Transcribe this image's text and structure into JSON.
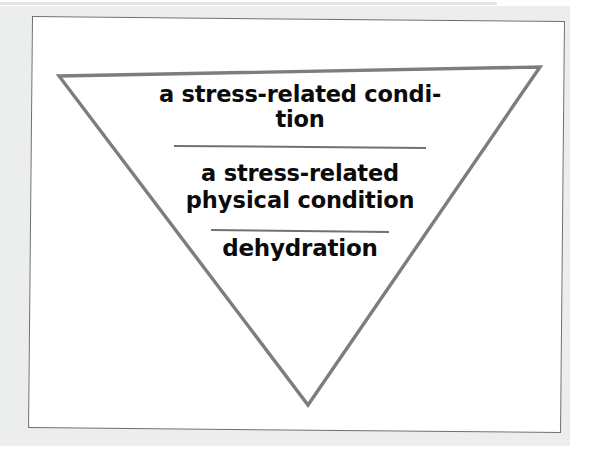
{
  "figure": {
    "type": "inverted-triangle-hierarchy",
    "levels": [
      {
        "rank": 1,
        "scope": "broad",
        "text": "a stress-related condi-tion",
        "line_1": "a stress-related condi-",
        "line_2": "tion"
      },
      {
        "rank": 2,
        "scope": "intermediate",
        "text": "a stress-related physical condition",
        "line_1": "a stress-related",
        "line_2_emphasis": "physical",
        "line_2_rest": " condition"
      },
      {
        "rank": 3,
        "scope": "specific",
        "text": "dehydration"
      }
    ],
    "dividers": [
      {
        "index": 1,
        "between": "level-1-and-level-2"
      },
      {
        "index": 2,
        "between": "level-2-and-level-3"
      }
    ]
  },
  "colors": {
    "triangle_stroke": "#7b7d7f",
    "frame_border": "#6d6f71",
    "divider": "#6f7173",
    "text": "#0b0b0b",
    "page_background": "#ffffff",
    "scan_backdrop": "#eceded"
  }
}
